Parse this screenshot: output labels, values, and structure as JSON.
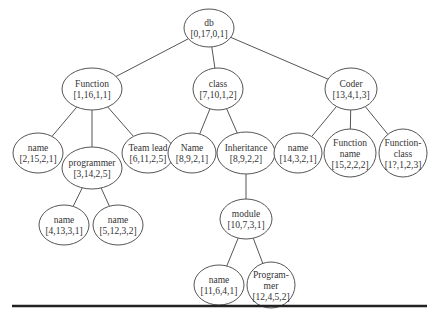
{
  "diagram": {
    "type": "tree",
    "nodes": [
      {
        "id": "db",
        "lines": [
          "db",
          "[0,17,0,1]"
        ],
        "cx": 209,
        "cy": 28,
        "rx": 25,
        "ry": 19
      },
      {
        "id": "function",
        "lines": [
          "Function",
          "[1,16,1,1]"
        ],
        "cx": 92,
        "cy": 89,
        "rx": 30,
        "ry": 21
      },
      {
        "id": "class",
        "lines": [
          "class",
          "[7,10,1,2]"
        ],
        "cx": 218,
        "cy": 89,
        "rx": 25,
        "ry": 21
      },
      {
        "id": "coder",
        "lines": [
          "Coder",
          "[13,4,1,3]"
        ],
        "cx": 351,
        "cy": 89,
        "rx": 26,
        "ry": 21
      },
      {
        "id": "name-2",
        "lines": [
          "name",
          "[2,15,2,1]"
        ],
        "cx": 38,
        "cy": 153,
        "rx": 25,
        "ry": 20
      },
      {
        "id": "programmer",
        "lines": [
          "programmer",
          "[3,14,2,5]"
        ],
        "cx": 92,
        "cy": 168,
        "rx": 30,
        "ry": 21
      },
      {
        "id": "team-lead",
        "lines": [
          "Team lead",
          "[6,11,2,5]"
        ],
        "cx": 148,
        "cy": 153,
        "rx": 26,
        "ry": 20
      },
      {
        "id": "name-8",
        "lines": [
          "Name",
          "[8,9,2,1]"
        ],
        "cx": 192,
        "cy": 153,
        "rx": 24,
        "ry": 20
      },
      {
        "id": "inheritance",
        "lines": [
          "Inheritance",
          "[8,9,2,2]"
        ],
        "cx": 246,
        "cy": 153,
        "rx": 29,
        "ry": 21
      },
      {
        "id": "name-14",
        "lines": [
          "name",
          "[14,3,2,1]"
        ],
        "cx": 298,
        "cy": 153,
        "rx": 24,
        "ry": 20
      },
      {
        "id": "function-name",
        "lines": [
          "Function",
          "name",
          "[15,2,2,2]"
        ],
        "cx": 350,
        "cy": 153,
        "rx": 26,
        "ry": 24
      },
      {
        "id": "function-class",
        "lines": [
          "Function-",
          "class",
          "[1?,1,2,3]"
        ],
        "cx": 403,
        "cy": 153,
        "rx": 24,
        "ry": 24
      },
      {
        "id": "name-4",
        "lines": [
          "name",
          "[4,13,3,1]"
        ],
        "cx": 64,
        "cy": 225,
        "rx": 25,
        "ry": 20
      },
      {
        "id": "name-5",
        "lines": [
          "name",
          "[5,12,3,2]"
        ],
        "cx": 118,
        "cy": 225,
        "rx": 25,
        "ry": 20
      },
      {
        "id": "module",
        "lines": [
          "module",
          "[10,7,3,1]"
        ],
        "cx": 246,
        "cy": 219,
        "rx": 26,
        "ry": 20
      },
      {
        "id": "name-11",
        "lines": [
          "name",
          "[11,6,4,1]"
        ],
        "cx": 219,
        "cy": 285,
        "rx": 25,
        "ry": 20
      },
      {
        "id": "programmer-12",
        "lines": [
          "Program-",
          "mer",
          "[12,4,5,2]"
        ],
        "cx": 271,
        "cy": 285,
        "rx": 24,
        "ry": 23
      }
    ],
    "edges": [
      [
        "db",
        "function"
      ],
      [
        "db",
        "class"
      ],
      [
        "db",
        "coder"
      ],
      [
        "function",
        "name-2"
      ],
      [
        "function",
        "programmer"
      ],
      [
        "function",
        "team-lead"
      ],
      [
        "class",
        "name-8"
      ],
      [
        "class",
        "inheritance"
      ],
      [
        "coder",
        "name-14"
      ],
      [
        "coder",
        "function-name"
      ],
      [
        "coder",
        "function-class"
      ],
      [
        "programmer",
        "name-4"
      ],
      [
        "programmer",
        "name-5"
      ],
      [
        "inheritance",
        "module"
      ],
      [
        "module",
        "name-11"
      ],
      [
        "module",
        "programmer-12"
      ]
    ],
    "rule": {
      "x1": 12,
      "x2": 427,
      "y": 306
    },
    "colors": {
      "stroke": "#555555",
      "text": "#333333",
      "rule": "#222222"
    }
  }
}
